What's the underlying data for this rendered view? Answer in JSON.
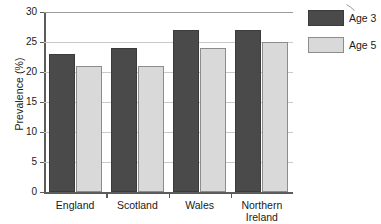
{
  "chart_data": {
    "type": "bar",
    "title": "",
    "subtitle": "",
    "xlabel": "",
    "ylabel": "Prevalence (%)",
    "categories": [
      "England",
      "Scotland",
      "Wales",
      "Northern\nIreland"
    ],
    "series": [
      {
        "name": "Age 3",
        "values": [
          23,
          24,
          27,
          27
        ],
        "color": "#4a4a4a"
      },
      {
        "name": "Age 5",
        "values": [
          21,
          21,
          24,
          25
        ],
        "color": "#d9d9d9"
      }
    ],
    "ylim": [
      0,
      30
    ],
    "yticks": [
      0,
      5,
      10,
      15,
      20,
      25,
      30
    ],
    "ytick_labels": [
      "0",
      "5",
      "10",
      "15",
      "20",
      "25",
      "30"
    ],
    "grid": "horizontal",
    "legend_position": "right-top",
    "legend": [
      "Age 3",
      "Age 5"
    ]
  }
}
